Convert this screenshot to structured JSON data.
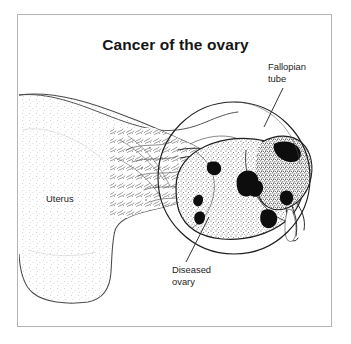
{
  "figure": {
    "title": "Cancer of the ovary",
    "background_color": "#ffffff",
    "frame_color": "#b4b4b4",
    "ink_color": "#1d1d1d",
    "labels": {
      "fallopian_tube": "Fallopian\ntube",
      "uterus": "Uterus",
      "diseased_ovary": "Diseased\novary"
    }
  },
  "diagram": {
    "type": "medical-illustration",
    "style": "black-and-white line drawing with stipple shading",
    "parts": [
      {
        "name": "uterus",
        "label": "Uterus",
        "description": "large pale organ body at left, stipple shaded, extends off left edge of frame"
      },
      {
        "name": "fallopian-tube",
        "label": "Fallopian tube",
        "description": "tube running along upper right toward the fimbriae at the right of the ovarian mass"
      },
      {
        "name": "diseased-ovary",
        "label": "Diseased ovary",
        "description": "enlarged irregular tumour mass with dark necrotic lesions, shown inside magnifier circle"
      },
      {
        "name": "magnifier-circle",
        "label": "",
        "description": "circular inset outline enlarging the diseased ovary region"
      }
    ]
  }
}
